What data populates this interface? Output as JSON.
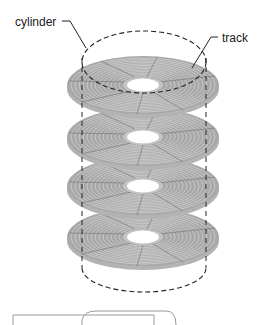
{
  "diagram": {
    "labels": {
      "cylinder": "cylinder",
      "track": "track"
    },
    "platter_count": 4,
    "colors": {
      "platter_fill": "#a9a9a9",
      "platter_rim": "#b8b8b8",
      "track_line": "#6e6e6e",
      "hub": "#ffffff",
      "dashed_line": "#222222",
      "box_stroke": "#9a9a9a"
    }
  }
}
